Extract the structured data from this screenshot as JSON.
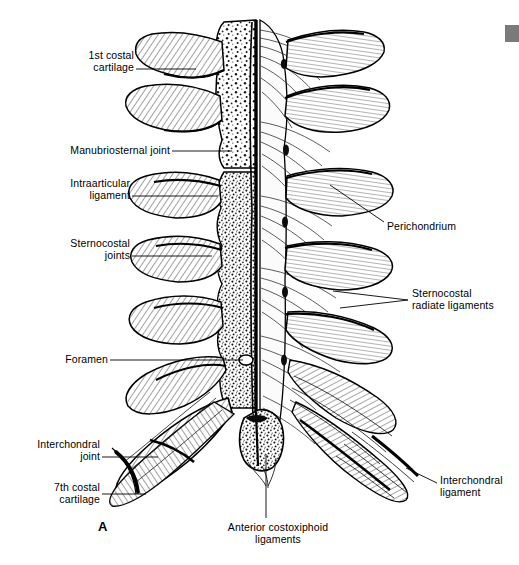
{
  "figure": {
    "letter": "A",
    "letter_x": 98,
    "letter_y": 519,
    "title_absent": true,
    "background_color": "#ffffff",
    "ink_color": "#000000",
    "width": 519,
    "height": 565
  },
  "corner_tab": {
    "name": "page-edge-tab",
    "color": "#7a7a7a",
    "x": 505,
    "y": 25,
    "width": 14,
    "height": 17
  },
  "labels": [
    {
      "id": "first-costal-cartilage",
      "text": "1st costal\ncartilage",
      "align": "right",
      "x": 34,
      "y": 50,
      "width": 100,
      "leader": "M136,69 L196,69"
    },
    {
      "id": "manubriosternal-joint",
      "text": "Manubriosternal joint",
      "align": "right",
      "x": 50,
      "y": 145,
      "width": 120,
      "leader": "M172,151 L232,151"
    },
    {
      "id": "intraarticular-ligament",
      "text": "Intraarticular\nligament",
      "align": "right",
      "x": 30,
      "y": 178,
      "width": 100,
      "leader": "M132,196 L218,196"
    },
    {
      "id": "sternocostal-joints",
      "text": "Sternocostal\njoints",
      "align": "right",
      "x": 30,
      "y": 238,
      "width": 100,
      "leader": "M132,256 L212,256"
    },
    {
      "id": "foramen",
      "text": "Foramen",
      "align": "right",
      "x": 40,
      "y": 354,
      "width": 68,
      "leader": "M110,360 L243,360"
    },
    {
      "id": "interchondral-joint",
      "text": "Interchondral\njoint",
      "align": "right",
      "x": 10,
      "y": 439,
      "width": 90,
      "leader": "M102,457 L158,457"
    },
    {
      "id": "seventh-costal-cartilage",
      "text": "7th costal\ncartilage",
      "align": "right",
      "x": 14,
      "y": 482,
      "width": 86,
      "leader": "M102,494 L146,494"
    },
    {
      "id": "perichondrium",
      "text": "Perichondrium",
      "align": "left",
      "x": 387,
      "y": 221,
      "width": 110,
      "leader": "M384,222 L330,185"
    },
    {
      "id": "sternocostal-radiate-ligaments",
      "text": "Sternocostal\nradiate ligaments",
      "align": "left",
      "x": 412,
      "y": 288,
      "width": 110,
      "leader": "M408,300 L333,291"
    },
    {
      "id": "interchondral-ligament",
      "text": "Interchondral\nligament",
      "align": "left",
      "x": 440,
      "y": 475,
      "width": 78,
      "leader": "M437,483 L408,470"
    },
    {
      "id": "anterior-costoxiphoid-ligaments",
      "text": "Anterior costoxiphoid ligaments",
      "align": "center",
      "x": 206,
      "y": 522,
      "width": 144,
      "leader": "M266,518 L266,454"
    }
  ],
  "anatomy": {
    "description": "Anterior view of sternum; left half sectioned showing cancellous bone stipple, right half intact with radiate ligament fibers",
    "sternum": {
      "manubrium_top_y": 20,
      "body_left_x": 222,
      "body_right_x": 283,
      "body_top_y": 20,
      "body_bottom_y": 430,
      "midline_x": 258
    },
    "rib_pairs": 7,
    "left_rib_ys": [
      62,
      108,
      155,
      205,
      255,
      305,
      355
    ],
    "right_rib_ys": [
      62,
      108,
      155,
      205,
      255,
      305,
      355
    ]
  }
}
